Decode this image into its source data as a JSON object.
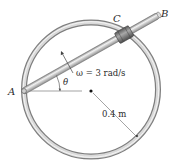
{
  "diagram": {
    "type": "kinematics-figure",
    "labels": {
      "point_a": "A",
      "point_b": "B",
      "collar_c": "C",
      "angle": "θ",
      "angular_velocity": "ω = 3 rad/s",
      "radius": "0.4 m"
    },
    "elements": [
      {
        "id": "ring",
        "kind": "circular-ring-rod",
        "center": [
          91,
          90
        ],
        "radius": 67
      },
      {
        "id": "rod-ab",
        "kind": "straight-rod",
        "from": "A",
        "to": "B"
      },
      {
        "id": "collar",
        "kind": "sliding-collar",
        "label": "C"
      },
      {
        "id": "pivot",
        "kind": "pin",
        "label": "A"
      },
      {
        "id": "center",
        "kind": "dot"
      },
      {
        "id": "omega-arrow",
        "kind": "rotation-arrow"
      },
      {
        "id": "theta-arc",
        "kind": "angle-arc"
      },
      {
        "id": "radius-line",
        "kind": "dimension-line"
      }
    ],
    "colors": {
      "ring": "#9a9a9a",
      "ring_highlight": "#e8e8e8",
      "rod": "#b0b0b0",
      "collar": "#6e6e6e",
      "text": "#2a2a2a",
      "line": "#555555"
    }
  }
}
